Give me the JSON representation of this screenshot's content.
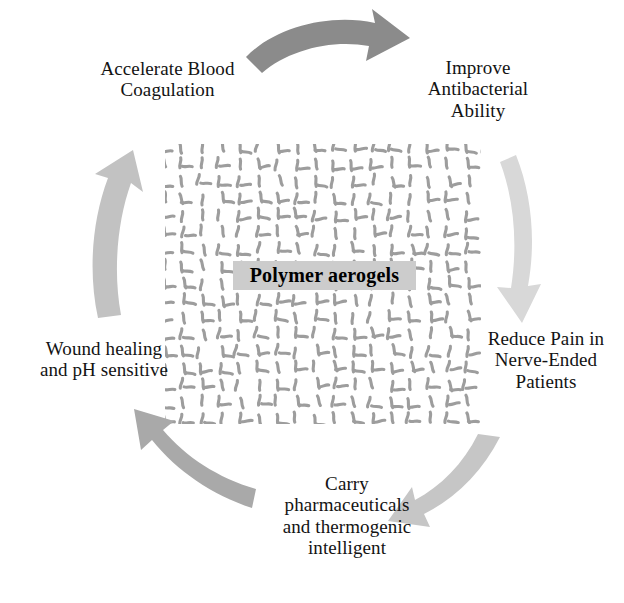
{
  "figure": {
    "type": "cycle-diagram",
    "center": {
      "label": "Polymer aerogels",
      "box_color": "#cccccc",
      "texture": "polymer-network-mesh",
      "texture_color": "#9a9a9a"
    },
    "nodes": [
      {
        "id": "accelerate-blood-coagulation",
        "text": "Accelerate Blood\nCoagulation",
        "position": "top-left"
      },
      {
        "id": "improve-antibacterial-ability",
        "text": "Improve\nAntibacterial\nAbility",
        "position": "top-right"
      },
      {
        "id": "reduce-pain-in-nerve-ended-patients",
        "text": "Reduce Pain in\nNerve-Ended\nPatients",
        "position": "right"
      },
      {
        "id": "carry-pharmaceuticals",
        "text": "Carry\npharmaceuticals\nand thermogenic\nintelligent",
        "position": "bottom"
      },
      {
        "id": "wound-healing-ph-sensitive",
        "text": "Wound healing\nand pH sensitive",
        "position": "left"
      }
    ],
    "arrows": [
      {
        "id": "arrow-top",
        "direction": "clockwise",
        "from": "accelerate-blood-coagulation",
        "to": "improve-antibacterial-ability",
        "color": "#8b8b8b"
      },
      {
        "id": "arrow-right",
        "direction": "clockwise",
        "from": "improve-antibacterial-ability",
        "to": "reduce-pain-in-nerve-ended-patients",
        "color": "#d8d8d8"
      },
      {
        "id": "arrow-bottom-right",
        "direction": "clockwise",
        "from": "reduce-pain-in-nerve-ended-patients",
        "to": "carry-pharmaceuticals",
        "color": "#c6c6c6"
      },
      {
        "id": "arrow-bottom-left",
        "direction": "clockwise",
        "from": "carry-pharmaceuticals",
        "to": "wound-healing-ph-sensitive",
        "color": "#a9a9a9"
      },
      {
        "id": "arrow-left",
        "direction": "clockwise",
        "from": "wound-healing-ph-sensitive",
        "to": "accelerate-blood-coagulation",
        "color": "#c2c2c2"
      }
    ]
  }
}
